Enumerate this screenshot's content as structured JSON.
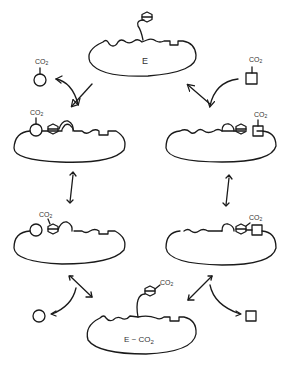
{
  "diagram": {
    "title": "",
    "colors": {
      "stroke": "#1a1a1a",
      "background": "#ffffff"
    },
    "nodes": [
      {
        "id": "enzyme_free",
        "label": "E"
      },
      {
        "id": "enzyme_circle_substrate",
        "label": ""
      },
      {
        "id": "enzyme_square_substrate",
        "label": ""
      },
      {
        "id": "enzyme_circle_transfer",
        "label": ""
      },
      {
        "id": "enzyme_square_transfer",
        "label": ""
      },
      {
        "id": "enzyme_carboxylated",
        "label": "E ~ CO2"
      }
    ],
    "labels": {
      "enzyme_top": "E",
      "enzyme_bottom": "E ~ CO",
      "enzyme_bottom_sub": "2",
      "co2": "CO",
      "co2_sub": "2"
    },
    "edges": [
      {
        "from": "circle_co2",
        "to": "enzyme_circle_substrate",
        "type": "reversible-curved"
      },
      {
        "from": "square_co2",
        "to": "enzyme_square_substrate",
        "type": "reversible-curved"
      },
      {
        "from": "enzyme_circle_substrate",
        "to": "enzyme_circle_transfer",
        "type": "reversible"
      },
      {
        "from": "enzyme_square_substrate",
        "to": "enzyme_square_transfer",
        "type": "reversible"
      },
      {
        "from": "enzyme_circle_transfer",
        "to": "circle_product",
        "type": "reversible-curved"
      },
      {
        "from": "enzyme_square_transfer",
        "to": "square_product",
        "type": "reversible-curved"
      }
    ]
  }
}
